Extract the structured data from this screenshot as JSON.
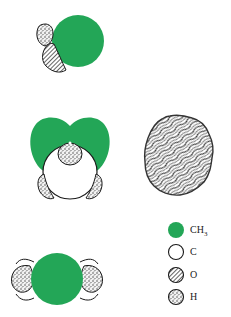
{
  "colors": {
    "ch3": "#23a657",
    "carbon": "#ffffff",
    "outline": "#1a1a1a"
  },
  "figures": [
    {
      "name": "molecule-side-view",
      "atoms": [
        "CH3",
        "O",
        "H"
      ]
    },
    {
      "name": "molecule-front-view",
      "atoms": [
        "CH3",
        "CH3",
        "C",
        "H",
        "H",
        "H"
      ]
    },
    {
      "name": "crystal-packing-blob",
      "texture": "wavy-hatch"
    },
    {
      "name": "molecule-top-view",
      "atoms": [
        "CH3",
        "C",
        "C",
        "H",
        "H"
      ]
    }
  ],
  "legend": {
    "items": [
      {
        "symbol": "CH",
        "sub": "3",
        "key": "CH3"
      },
      {
        "symbol": "C",
        "sub": "",
        "key": "C"
      },
      {
        "symbol": "O",
        "sub": "",
        "key": "O"
      },
      {
        "symbol": "H",
        "sub": "",
        "key": "H"
      }
    ]
  }
}
